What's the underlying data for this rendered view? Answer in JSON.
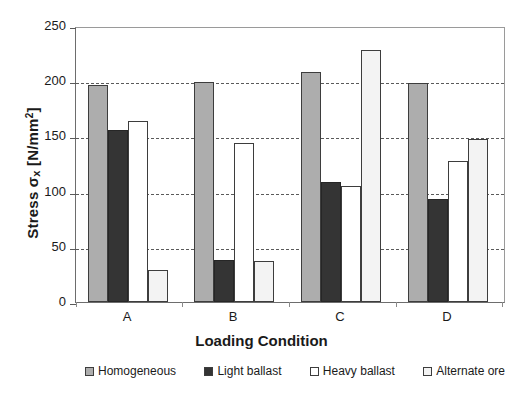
{
  "chart_data": {
    "type": "bar",
    "title": "",
    "xlabel": "Loading Condition",
    "ylabel_prefix": "Stress ",
    "ylabel_symbol": "σ",
    "ylabel_subscript": "x",
    "ylabel_units": " [N/mm",
    "ylabel_units_sup": "2",
    "ylabel_units_end": "]",
    "ylabel_full": "Stress σx [N/mm2]",
    "categories": [
      "A",
      "B",
      "C",
      "D"
    ],
    "ylim": [
      0,
      250
    ],
    "yticks": [
      0,
      50,
      100,
      150,
      200,
      250
    ],
    "grid": "horizontal-dashed",
    "legend_position": "bottom",
    "series": [
      {
        "name": "Homogeneous",
        "color": "#adadad",
        "values": [
          197,
          199,
          208,
          198
        ]
      },
      {
        "name": "Light ballast",
        "color": "#343434",
        "values": [
          156,
          38,
          109,
          93
        ]
      },
      {
        "name": "Heavy ballast",
        "color": "#ffffff",
        "values": [
          164,
          144,
          105,
          128
        ]
      },
      {
        "name": "Alternate ore",
        "color": "#f3f3f3",
        "values": [
          29,
          37,
          228,
          148
        ]
      }
    ]
  }
}
